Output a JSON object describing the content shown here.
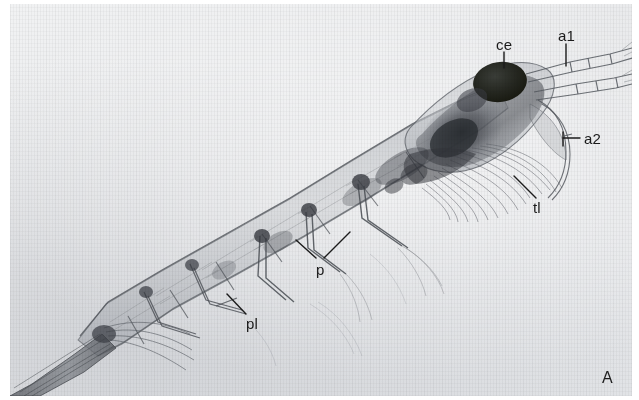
{
  "figure": {
    "panel_letter": "A",
    "plate_background_color": "#e7e8ea",
    "ink_color": "#1b1b1b"
  },
  "annotations": [
    {
      "key": "ce",
      "label": "ce",
      "meaning": "compound-eye",
      "label_x": 496,
      "label_y": 37,
      "leader": [
        [
          504,
          52
        ],
        [
          504,
          68
        ]
      ]
    },
    {
      "key": "a1",
      "label": "a1",
      "meaning": "antennule",
      "label_x": 558,
      "label_y": 28,
      "leader": [
        [
          566,
          44
        ],
        [
          566,
          66
        ]
      ]
    },
    {
      "key": "a2",
      "label": "a2",
      "meaning": "antenna",
      "label_x": 584,
      "label_y": 131,
      "leader": [
        [
          580,
          138
        ],
        [
          563,
          138
        ]
      ]
    },
    {
      "key": "tl",
      "label": "tl",
      "meaning": "thoracic-limbs",
      "label_x": 533,
      "label_y": 200,
      "leader": [
        [
          534,
          198
        ],
        [
          514,
          176
        ]
      ]
    },
    {
      "key": "p",
      "label": "p",
      "meaning": "pereopods",
      "label_x": 316,
      "label_y": 262,
      "leader": [
        [
          316,
          258
        ],
        [
          296,
          240
        ]
      ],
      "leader2": [
        [
          324,
          258
        ],
        [
          350,
          232
        ]
      ]
    },
    {
      "key": "pl",
      "label": "pl",
      "meaning": "pleopods",
      "label_x": 246,
      "label_y": 316,
      "leader": [
        [
          246,
          314
        ],
        [
          227,
          294
        ]
      ]
    }
  ]
}
